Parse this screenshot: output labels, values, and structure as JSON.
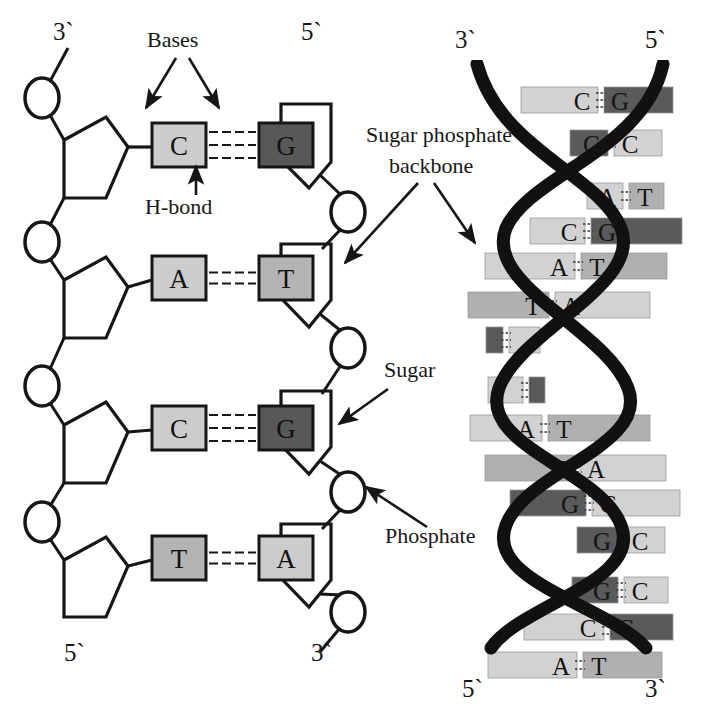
{
  "figure": {
    "background_color": "#ffffff",
    "ink_color": "#161616"
  },
  "palette": {
    "base_light": "#cccccc",
    "base_medium": "#b4b4b4",
    "base_dark": "#585858",
    "backbone_black": "#111111",
    "outline": "#161616",
    "helix_light": "#d2d2d2",
    "helix_medium": "#b0b0b0",
    "helix_dark": "#5a5a5a"
  },
  "ladder_diagram": {
    "corner_labels": {
      "top_left": "3`",
      "top_right": "5`",
      "bottom_left": "5`",
      "bottom_right": "3`"
    },
    "annotations": [
      {
        "id": "bases",
        "text": "Bases",
        "x": 185,
        "y": 38
      },
      {
        "id": "h-bond",
        "text": "H-bond",
        "x": 190,
        "y": 198
      }
    ],
    "rungs": [
      {
        "left_base": "C",
        "right_base": "G",
        "left_shade": "light",
        "right_shade": "dark",
        "hbonds": 3,
        "y": 145
      },
      {
        "left_base": "A",
        "right_base": "T",
        "left_shade": "light",
        "right_shade": "medium",
        "hbonds": 2,
        "y": 278
      },
      {
        "left_base": "C",
        "right_base": "G",
        "left_shade": "light",
        "right_shade": "dark",
        "hbonds": 3,
        "y": 428
      },
      {
        "left_base": "T",
        "right_base": "A",
        "left_shade": "medium",
        "right_shade": "light",
        "hbonds": 2,
        "y": 558
      }
    ],
    "component_labels": {
      "sugar_phosphate_backbone_line1": "Sugar phosphate",
      "sugar_phosphate_backbone_line2": "backbone",
      "sugar": "Sugar",
      "phosphate": "Phosphate"
    }
  },
  "helix_diagram": {
    "end_labels": {
      "top_left": "3`",
      "top_right": "5`",
      "bottom_left": "5`",
      "bottom_right": "3`"
    },
    "rungs": [
      {
        "left_base": "C",
        "right_base": "G",
        "left_shade": "light",
        "right_shade": "dark",
        "y": 100,
        "x_left": 521,
        "x_right": 673,
        "split": 601,
        "hbonds": 3,
        "letters_visible": true
      },
      {
        "left_base": "G",
        "right_base": "C",
        "left_shade": "dark",
        "right_shade": "light",
        "y": 143,
        "x_left": 570,
        "x_right": 662,
        "split": 611,
        "hbonds": 2,
        "letters_visible": true
      },
      {
        "left_base": "A",
        "right_base": "T",
        "left_shade": "light",
        "right_shade": "medium",
        "y": 196,
        "x_left": 587,
        "x_right": 664,
        "split": 626,
        "hbonds": 2,
        "letters_visible": true
      },
      {
        "left_base": "C",
        "right_base": "G",
        "left_shade": "light",
        "right_shade": "dark",
        "y": 231,
        "x_left": 530,
        "x_right": 682,
        "split": 588,
        "hbonds": 3,
        "letters_visible": true
      },
      {
        "left_base": "A",
        "right_base": "T",
        "left_shade": "light",
        "right_shade": "medium",
        "y": 266,
        "x_left": 485,
        "x_right": 667,
        "split": 578,
        "hbonds": 2,
        "letters_visible": true
      },
      {
        "left_base": "T",
        "right_base": "A",
        "left_shade": "medium",
        "right_shade": "light",
        "y": 305,
        "x_left": 468,
        "x_right": 650,
        "split": 552,
        "hbonds": 2,
        "letters_visible": true
      },
      {
        "left_base": "G",
        "right_base": "C",
        "left_shade": "dark",
        "right_shade": "light",
        "y": 340,
        "x_left": 486,
        "x_right": 540,
        "split": 506,
        "hbonds": 3,
        "letters_visible": false
      },
      {
        "left_base": "C",
        "right_base": "G",
        "left_shade": "light",
        "right_shade": "dark",
        "y": 390,
        "x_left": 488,
        "x_right": 545,
        "split": 526,
        "hbonds": 3,
        "letters_visible": false
      },
      {
        "left_base": "A",
        "right_base": "T",
        "left_shade": "light",
        "right_shade": "medium",
        "y": 428,
        "x_left": 470,
        "x_right": 650,
        "split": 545,
        "hbonds": 2,
        "letters_visible": true
      },
      {
        "left_base": "T",
        "right_base": "A",
        "left_shade": "medium",
        "right_shade": "light",
        "y": 468,
        "x_left": 485,
        "x_right": 666,
        "split": 577,
        "hbonds": 2,
        "letters_visible": true
      },
      {
        "left_base": "G",
        "right_base": "C",
        "left_shade": "dark",
        "right_shade": "light",
        "y": 503,
        "x_left": 510,
        "x_right": 680,
        "split": 589,
        "hbonds": 3,
        "letters_visible": true
      },
      {
        "left_base": "G",
        "right_base": "C",
        "left_shade": "dark",
        "right_shade": "light",
        "y": 540,
        "x_left": 577,
        "x_right": 665,
        "split": 621,
        "hbonds": 3,
        "letters_visible": true
      },
      {
        "left_base": "G",
        "right_base": "C",
        "left_shade": "dark",
        "right_shade": "light",
        "y": 590,
        "x_left": 572,
        "x_right": 668,
        "split": 621,
        "hbonds": 3,
        "letters_visible": true
      },
      {
        "left_base": "C",
        "right_base": "G",
        "left_shade": "light",
        "right_shade": "dark",
        "y": 627,
        "x_left": 524,
        "x_right": 673,
        "split": 607,
        "hbonds": 3,
        "letters_visible": true
      },
      {
        "left_base": "A",
        "right_base": "T",
        "left_shade": "light",
        "right_shade": "medium",
        "y": 665,
        "x_left": 488,
        "x_right": 662,
        "split": 580,
        "hbonds": 2,
        "letters_visible": true
      }
    ]
  }
}
